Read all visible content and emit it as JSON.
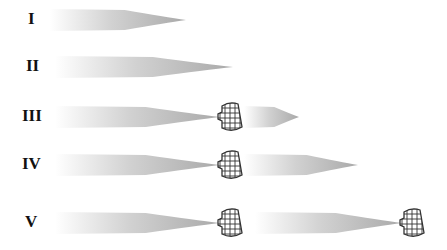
{
  "rows": [
    {
      "label": "I",
      "y": 20,
      "plumes": [
        {
          "x0": 50,
          "x1": 186
        }
      ],
      "nets": []
    },
    {
      "label": "II",
      "y": 67,
      "plumes": [
        {
          "x0": 55,
          "x1": 233
        }
      ],
      "nets": []
    },
    {
      "label": "III",
      "y": 117,
      "plumes": [
        {
          "x0": 55,
          "x1": 220
        },
        {
          "x0": 244,
          "x1": 299
        }
      ],
      "nets": [
        218
      ]
    },
    {
      "label": "IV",
      "y": 165,
      "plumes": [
        {
          "x0": 55,
          "x1": 220
        },
        {
          "x0": 244,
          "x1": 358
        }
      ],
      "nets": [
        218
      ]
    },
    {
      "label": "V",
      "y": 223,
      "plumes": [
        {
          "x0": 55,
          "x1": 220
        },
        {
          "x0": 255,
          "x1": 402
        }
      ],
      "nets": [
        218,
        400
      ]
    }
  ],
  "colors": {
    "plume": "#9a9a9a",
    "net": "#333333",
    "label": "#111111"
  }
}
